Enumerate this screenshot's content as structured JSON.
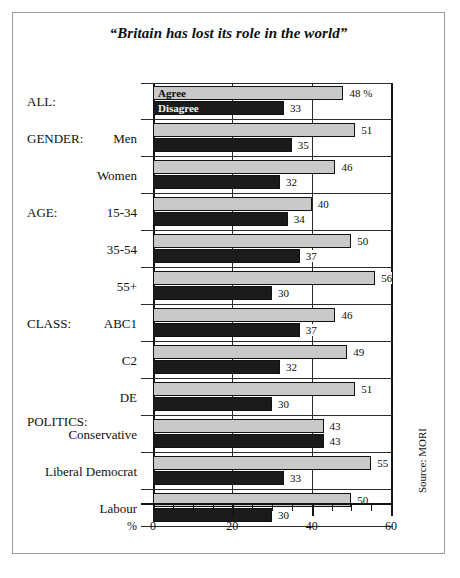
{
  "figure": {
    "title": "“Britain has lost its role in the world”",
    "source": "Source: MORI",
    "percent_symbol": "%"
  },
  "legend": {
    "agree_label": "Agree",
    "disagree_label": "Disagree",
    "agree_color": "#c9c9c9",
    "disagree_color": "#1b1b1b"
  },
  "group_headings": {
    "all": "ALL:",
    "gender": "GENDER:",
    "age": "AGE:",
    "class": "CLASS:",
    "politics": "POLITICS:"
  },
  "axis": {
    "tick_labels": [
      "0",
      "20",
      "40",
      "60"
    ],
    "tick_values": [
      0,
      20,
      40,
      60
    ],
    "minor_step": 5,
    "min": 0,
    "max": 60
  },
  "rows": [
    {
      "label": "",
      "heading": "ALL:",
      "agree": 48,
      "disagree": 33,
      "agree_text": "48 %",
      "disagree_text": "33"
    },
    {
      "label": "Men",
      "heading": "GENDER:",
      "agree": 51,
      "disagree": 35,
      "agree_text": "51",
      "disagree_text": "35"
    },
    {
      "label": "Women",
      "heading": "",
      "agree": 46,
      "disagree": 32,
      "agree_text": "46",
      "disagree_text": "32"
    },
    {
      "label": "15-34",
      "heading": "AGE:",
      "agree": 40,
      "disagree": 34,
      "agree_text": "40",
      "disagree_text": "34"
    },
    {
      "label": "35-54",
      "heading": "",
      "agree": 50,
      "disagree": 37,
      "agree_text": "50",
      "disagree_text": "37"
    },
    {
      "label": "55+",
      "heading": "",
      "agree": 56,
      "disagree": 30,
      "agree_text": "56",
      "disagree_text": "30"
    },
    {
      "label": "ABC1",
      "heading": "CLASS:",
      "agree": 46,
      "disagree": 37,
      "agree_text": "46",
      "disagree_text": "37"
    },
    {
      "label": "C2",
      "heading": "",
      "agree": 49,
      "disagree": 32,
      "agree_text": "49",
      "disagree_text": "32"
    },
    {
      "label": "DE",
      "heading": "",
      "agree": 51,
      "disagree": 30,
      "agree_text": "51",
      "disagree_text": "30"
    },
    {
      "label": "Conservative",
      "heading": "POLITICS:",
      "agree": 43,
      "disagree": 43,
      "agree_text": "43",
      "disagree_text": "43"
    },
    {
      "label": "Liberal Democrat",
      "heading": "",
      "agree": 55,
      "disagree": 33,
      "agree_text": "55",
      "disagree_text": "33"
    },
    {
      "label": "Labour",
      "heading": "",
      "agree": 50,
      "disagree": 30,
      "agree_text": "50",
      "disagree_text": "30"
    }
  ],
  "chart_data": {
    "type": "bar",
    "orientation": "horizontal",
    "title": "“Britain has lost its role in the world”",
    "xlabel": "%",
    "ylabel": "",
    "xlim": [
      0,
      60
    ],
    "grid": true,
    "legend_position": "inline-first-bars",
    "categories": [
      "ALL",
      "Men",
      "Women",
      "15-34",
      "35-54",
      "55+",
      "ABC1",
      "C2",
      "DE",
      "Conservative",
      "Liberal Democrat",
      "Labour"
    ],
    "series": [
      {
        "name": "Agree",
        "values": [
          48,
          51,
          46,
          40,
          50,
          56,
          46,
          49,
          51,
          43,
          55,
          50
        ],
        "color": "#c9c9c9"
      },
      {
        "name": "Disagree",
        "values": [
          33,
          35,
          32,
          34,
          37,
          30,
          37,
          32,
          30,
          43,
          33,
          30
        ],
        "color": "#1b1b1b"
      }
    ],
    "annotations": [
      "Source: MORI"
    ]
  }
}
